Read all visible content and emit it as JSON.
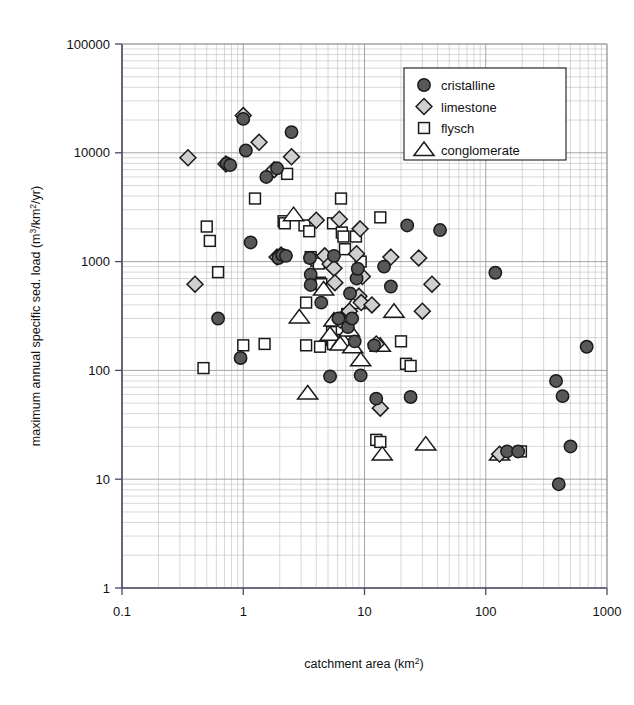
{
  "figure": {
    "width": 634,
    "height": 705,
    "background": "#ffffff"
  },
  "chart_data": {
    "type": "scatter",
    "title": "",
    "xlabel": "catchment area (km²)",
    "ylabel": "maximum annual specific sed. load (m³/km²/yr)",
    "xscale": "log",
    "yscale": "log",
    "xlim": [
      0.1,
      1000
    ],
    "ylim": [
      1,
      100000
    ],
    "xticks": [
      "0.1",
      "1",
      "10",
      "100",
      "1000"
    ],
    "xtick_values": [
      0.1,
      1,
      10,
      100,
      1000
    ],
    "yticks": [
      "1",
      "10",
      "100",
      "1000",
      "10000",
      "100000"
    ],
    "ytick_values": [
      1,
      10,
      100,
      1000,
      10000,
      100000
    ],
    "grid": "log-minor-both-axes",
    "grid_color": "#b8b8b8",
    "axis_color": "#4a4a66",
    "legend_position": "top-right",
    "legend_entries": [
      {
        "label": "cristalline",
        "marker": "circle",
        "fill": "#585858",
        "stroke": "#1a1a1a"
      },
      {
        "label": "limestone",
        "marker": "diamond",
        "fill": "#cfcfcf",
        "stroke": "#1a1a1a"
      },
      {
        "label": "flysch",
        "marker": "square",
        "fill": "#ffffff",
        "stroke": "#1a1a1a"
      },
      {
        "label": "conglomerate",
        "marker": "triangle",
        "fill": "#ffffff",
        "stroke": "#1a1a1a"
      }
    ],
    "series": [
      {
        "name": "cristalline",
        "marker": "circle",
        "fill": "#585858",
        "stroke": "#1a1a1a",
        "points": [
          [
            0.73,
            8000
          ],
          [
            0.78,
            7700
          ],
          [
            1.0,
            20500
          ],
          [
            1.05,
            10500
          ],
          [
            1.55,
            6000
          ],
          [
            1.9,
            7200
          ],
          [
            2.5,
            15500
          ],
          [
            1.15,
            1500
          ],
          [
            1.95,
            1080
          ],
          [
            2.1,
            1150
          ],
          [
            2.25,
            1130
          ],
          [
            3.55,
            1080
          ],
          [
            3.6,
            760
          ],
          [
            3.6,
            610
          ],
          [
            4.4,
            420
          ],
          [
            0.62,
            300
          ],
          [
            0.95,
            130
          ],
          [
            5.6,
            1130
          ],
          [
            6.1,
            300
          ],
          [
            7.3,
            250
          ],
          [
            7.6,
            510
          ],
          [
            7.9,
            300
          ],
          [
            8.3,
            185
          ],
          [
            8.6,
            700
          ],
          [
            8.8,
            860
          ],
          [
            5.2,
            88
          ],
          [
            9.3,
            90
          ],
          [
            12.0,
            170
          ],
          [
            12.5,
            55
          ],
          [
            14.5,
            900
          ],
          [
            16.5,
            590
          ],
          [
            22.5,
            2150
          ],
          [
            24.0,
            57
          ],
          [
            42.0,
            1950
          ],
          [
            120.0,
            790
          ],
          [
            150.0,
            18
          ],
          [
            185.0,
            18
          ],
          [
            380.0,
            80
          ],
          [
            400.0,
            9
          ],
          [
            430.0,
            58
          ],
          [
            500.0,
            20
          ],
          [
            680.0,
            165
          ]
        ]
      },
      {
        "name": "limestone",
        "marker": "diamond",
        "fill": "#cfcfcf",
        "stroke": "#1a1a1a",
        "points": [
          [
            0.35,
            9000
          ],
          [
            0.72,
            7900
          ],
          [
            1.0,
            22000
          ],
          [
            1.35,
            12500
          ],
          [
            1.8,
            7000
          ],
          [
            2.5,
            9200
          ],
          [
            0.4,
            620
          ],
          [
            1.9,
            1100
          ],
          [
            2.05,
            1150
          ],
          [
            4.0,
            2400
          ],
          [
            4.7,
            1130
          ],
          [
            5.2,
            950
          ],
          [
            5.6,
            870
          ],
          [
            5.7,
            640
          ],
          [
            6.2,
            2450
          ],
          [
            6.3,
            290
          ],
          [
            7.5,
            350
          ],
          [
            8.6,
            1180
          ],
          [
            9.2,
            2000
          ],
          [
            9.6,
            730
          ],
          [
            9.0,
            480
          ],
          [
            9.4,
            420
          ],
          [
            11.5,
            400
          ],
          [
            12.5,
            175
          ],
          [
            13.5,
            45
          ],
          [
            16.5,
            1100
          ],
          [
            28.0,
            1080
          ],
          [
            30.0,
            350
          ],
          [
            36.0,
            620
          ],
          [
            130.0,
            17
          ]
        ]
      },
      {
        "name": "flysch",
        "marker": "square",
        "fill": "#ffffff",
        "stroke": "#1a1a1a",
        "points": [
          [
            0.5,
            2100
          ],
          [
            0.53,
            1550
          ],
          [
            0.62,
            800
          ],
          [
            0.47,
            105
          ],
          [
            1.25,
            3800
          ],
          [
            2.3,
            6400
          ],
          [
            2.15,
            2350
          ],
          [
            2.2,
            2250
          ],
          [
            1.0,
            170
          ],
          [
            1.5,
            175
          ],
          [
            3.2,
            2150
          ],
          [
            3.5,
            1900
          ],
          [
            3.6,
            1100
          ],
          [
            4.0,
            1020
          ],
          [
            4.2,
            960
          ],
          [
            4.3,
            640
          ],
          [
            4.4,
            620
          ],
          [
            3.3,
            420
          ],
          [
            3.3,
            170
          ],
          [
            4.3,
            165
          ],
          [
            5.5,
            2250
          ],
          [
            5.4,
            225
          ],
          [
            5.4,
            190
          ],
          [
            5.5,
            175
          ],
          [
            6.4,
            3800
          ],
          [
            6.5,
            1850
          ],
          [
            6.7,
            1700
          ],
          [
            6.9,
            1300
          ],
          [
            6.5,
            240
          ],
          [
            7.2,
            330
          ],
          [
            7.7,
            185
          ],
          [
            8.5,
            1700
          ],
          [
            9.3,
            1000
          ],
          [
            13.5,
            2550
          ],
          [
            20.0,
            185
          ],
          [
            22.0,
            115
          ],
          [
            24.0,
            110
          ],
          [
            12.5,
            23
          ],
          [
            13.5,
            22
          ],
          [
            195.0,
            18
          ]
        ]
      },
      {
        "name": "conglomerate",
        "marker": "triangle",
        "fill": "#ffffff",
        "stroke": "#1a1a1a",
        "points": [
          [
            2.6,
            2700
          ],
          [
            2.9,
            310
          ],
          [
            3.4,
            62
          ],
          [
            4.6,
            560
          ],
          [
            5.6,
            290
          ],
          [
            5.2,
            215
          ],
          [
            6.6,
            190
          ],
          [
            6.3,
            175
          ],
          [
            7.5,
            235
          ],
          [
            8.0,
            165
          ],
          [
            9.3,
            125
          ],
          [
            8.4,
            420
          ],
          [
            13.5,
            170
          ],
          [
            17.5,
            350
          ],
          [
            14.0,
            17
          ],
          [
            32.0,
            21
          ],
          [
            130.0,
            17
          ]
        ]
      }
    ]
  },
  "axes": {
    "plot_left": 122,
    "plot_right": 607,
    "plot_top": 44,
    "plot_bottom": 588,
    "xlabel_text": "catchment area (km",
    "xlabel_sup": "2",
    "xlabel_tail": ")",
    "ylabel_head": "maximum annual specific sed. load (m",
    "ylabel_sup1": "3",
    "ylabel_mid": "/km",
    "ylabel_sup2": "2",
    "ylabel_tail": "/yr)"
  },
  "legend": {
    "box": {
      "x": 404,
      "y": 68,
      "width": 162,
      "height": 92
    },
    "items": [
      "cristalline",
      "limestone",
      "flysch",
      "conglomerate"
    ]
  }
}
